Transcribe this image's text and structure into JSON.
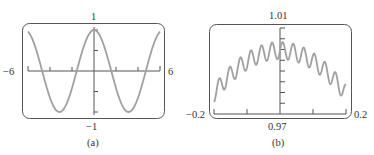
{
  "chart_data": [
    {
      "type": "line",
      "panel_label": "(a)",
      "title": "",
      "function_description": "y = cos(x)",
      "x_range": [
        -6,
        6
      ],
      "y_range": [
        -1,
        1
      ],
      "x_tick_labels": {
        "min": "−6",
        "max": "6"
      },
      "y_tick_labels": {
        "max": "1",
        "min": "−1"
      },
      "x_ticks": [
        -4,
        -2,
        2,
        4
      ],
      "y_ticks": [
        -1,
        -0.5,
        0.5,
        1
      ],
      "grid": false,
      "x": [
        -6,
        -5,
        -4,
        -3,
        -2,
        -1,
        0,
        1,
        2,
        3,
        4,
        5,
        6
      ],
      "values": [
        0.96,
        0.28,
        -0.65,
        -0.99,
        -0.42,
        0.54,
        1.0,
        0.54,
        -0.42,
        -0.99,
        -0.65,
        0.28,
        0.96
      ],
      "line_color": "#a0a0a0"
    },
    {
      "type": "line",
      "panel_label": "(b)",
      "title": "",
      "function_description": "y = cos(x) + small high-frequency oscillation",
      "x_range": [
        -0.2,
        0.2
      ],
      "y_range": [
        0.97,
        1.01
      ],
      "x_tick_labels": {
        "min": "−0.2",
        "max": "0.2"
      },
      "y_tick_labels": {
        "max": "1.01",
        "min": "0.97"
      },
      "x_ticks": [
        -0.1,
        0.1
      ],
      "y_ticks": [
        0.975,
        0.98,
        0.985,
        0.99,
        0.995,
        1.0,
        1.005,
        1.01
      ],
      "grid": false,
      "x": [
        -0.2,
        -0.15,
        -0.1,
        -0.05,
        0,
        0.05,
        0.1,
        0.15,
        0.2
      ],
      "values": [
        0.9765,
        0.985,
        0.993,
        0.998,
        1.0,
        0.998,
        0.993,
        0.985,
        0.98
      ],
      "oscillation": {
        "periods": 12.5,
        "amplitude": 0.004
      },
      "line_color": "#a0a0a0"
    }
  ],
  "labels": {
    "a": {
      "xmin": "−6",
      "xmax": "6",
      "ymax": "1",
      "ymin": "−1",
      "caption": "(a)"
    },
    "b": {
      "xmin": "−0.2",
      "xmax": "0.2",
      "ymax": "1.01",
      "ymin": "0.97",
      "caption": "(b)"
    }
  }
}
